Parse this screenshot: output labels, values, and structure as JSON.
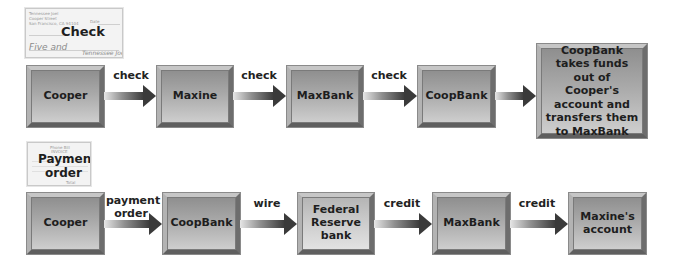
{
  "check_document": {
    "title": "Check",
    "payer_line1": "Tennessee Joel",
    "payer_line2": "Cooper Street",
    "payer_line3": "San Francisco, CA 94104",
    "date": "Date",
    "amount_words": "Five and",
    "signature": "Tennessee Joel"
  },
  "invoice_document": {
    "title_line1": "Payment",
    "title_line2": "order",
    "header1": "Phone Bill",
    "header2": "INVOICE",
    "total": "Total"
  },
  "row1": {
    "nodes": [
      {
        "label": "Cooper"
      },
      {
        "label": "Maxine"
      },
      {
        "label": "MaxBank"
      },
      {
        "label": "CoopBank"
      },
      {
        "label": "CoopBank takes funds out of Cooper's account and transfers them to MaxBank"
      }
    ],
    "edges": [
      {
        "label": "check"
      },
      {
        "label": "check"
      },
      {
        "label": "check"
      },
      {
        "label": ""
      }
    ]
  },
  "row2": {
    "nodes": [
      {
        "label": "Cooper"
      },
      {
        "label": "CoopBank"
      },
      {
        "label": "Federal Reserve bank"
      },
      {
        "label": "MaxBank"
      },
      {
        "label": "Maxine's account"
      }
    ],
    "edges": [
      {
        "label": "payment order"
      },
      {
        "label": "wire"
      },
      {
        "label": "credit"
      },
      {
        "label": "credit"
      }
    ]
  }
}
